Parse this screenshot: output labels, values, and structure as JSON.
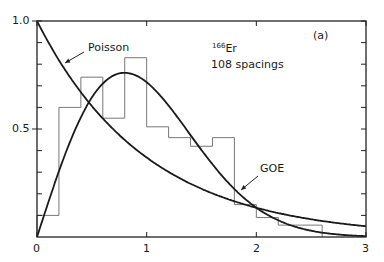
{
  "chart_data": {
    "type": "line",
    "title": "",
    "panel_label": "(a)",
    "annotation": {
      "isotope_mass": "166",
      "isotope_symbol": "Er",
      "spacings_text": "108  spacings"
    },
    "xlabel": "",
    "ylabel": "",
    "xlim": [
      0,
      3
    ],
    "ylim": [
      0,
      1.0
    ],
    "x_ticks": [
      0,
      1,
      2,
      3
    ],
    "x_tick_labels": [
      "0",
      "1",
      "2",
      "3"
    ],
    "y_ticks": [
      0.5,
      1.0
    ],
    "y_tick_labels": [
      "0.5",
      "1.0"
    ],
    "grid": false,
    "legend": null,
    "series": [
      {
        "name": "Poisson",
        "kind": "curve",
        "formula": "exp(-s)",
        "x": [
          0,
          0.25,
          0.5,
          0.75,
          1.0,
          1.25,
          1.5,
          1.75,
          2.0,
          2.25,
          2.5,
          2.75,
          3.0
        ],
        "values": [
          1.0,
          0.78,
          0.61,
          0.47,
          0.37,
          0.29,
          0.22,
          0.17,
          0.14,
          0.11,
          0.08,
          0.06,
          0.05
        ]
      },
      {
        "name": "GOE",
        "kind": "curve",
        "formula": "(pi/2) s exp(-pi s^2 / 4)",
        "x": [
          0,
          0.25,
          0.5,
          0.75,
          0.8,
          1.0,
          1.25,
          1.5,
          1.75,
          2.0,
          2.25,
          2.5,
          2.75,
          3.0
        ],
        "values": [
          0.0,
          0.37,
          0.64,
          0.76,
          0.76,
          0.72,
          0.58,
          0.4,
          0.25,
          0.14,
          0.07,
          0.03,
          0.01,
          0.0
        ]
      },
      {
        "name": "166Er histogram",
        "kind": "histogram",
        "bin_edges": [
          0,
          0.2,
          0.4,
          0.6,
          0.8,
          1.0,
          1.2,
          1.4,
          1.6,
          1.8,
          2.0,
          2.2,
          2.4,
          2.6
        ],
        "values": [
          0.1,
          0.6,
          0.74,
          0.55,
          0.83,
          0.51,
          0.46,
          0.42,
          0.46,
          0.15,
          0.09,
          0.055,
          0.055
        ]
      }
    ],
    "curve_labels": {
      "poisson": "Poisson",
      "goe": "GOE"
    }
  }
}
